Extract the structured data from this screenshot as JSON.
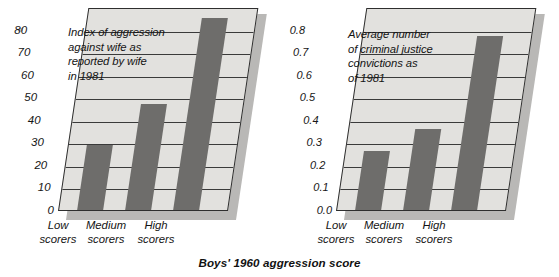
{
  "caption": "Boys' 1960 aggression score",
  "charts": [
    {
      "id": "aggression-index",
      "annotation": "Index of aggression\nagainst wife as\nreported by wife\nin 1981",
      "categories": [
        "Low\nscorers",
        "Medium\nscorers",
        "High\nscorers"
      ],
      "yticks": [
        "0",
        "10",
        "20",
        "30",
        "40",
        "50",
        "60",
        "70",
        "80"
      ]
    },
    {
      "id": "criminal-convictions",
      "annotation": "Average number\nof criminal justice\nconvictions as\nof 1981",
      "categories": [
        "Low\nscorers",
        "Medium\nscorers",
        "High\nscorers"
      ],
      "yticks": [
        "0.0",
        "0.1",
        "0.2",
        "0.3",
        "0.4",
        "0.5",
        "0.6",
        "0.7",
        "0.8"
      ]
    }
  ],
  "chart_data": [
    {
      "type": "bar",
      "title": "Index of aggression against wife as reported by wife in 1981",
      "categories": [
        "Low scorers",
        "Medium scorers",
        "High scorers"
      ],
      "values": [
        29,
        47,
        85
      ],
      "xlabel": "Boys' 1960 aggression score",
      "ylabel": "",
      "ylim": [
        0,
        90
      ],
      "yticks": [
        0,
        10,
        20,
        30,
        40,
        50,
        60,
        70,
        80
      ],
      "grid": true,
      "legend": "none",
      "bar_color": "#6e6d6b",
      "plot_bg": "#e2e1de"
    },
    {
      "type": "bar",
      "title": "Average number of criminal justice convictions as of 1981",
      "categories": [
        "Low scorers",
        "Medium scorers",
        "High scorers"
      ],
      "values": [
        0.26,
        0.36,
        0.77
      ],
      "xlabel": "Boys' 1960 aggression score",
      "ylabel": "",
      "ylim": [
        0.0,
        0.9
      ],
      "yticks": [
        0.0,
        0.1,
        0.2,
        0.3,
        0.4,
        0.5,
        0.6,
        0.7,
        0.8
      ],
      "grid": true,
      "legend": "none",
      "bar_color": "#6e6d6b",
      "plot_bg": "#e2e1de"
    }
  ]
}
